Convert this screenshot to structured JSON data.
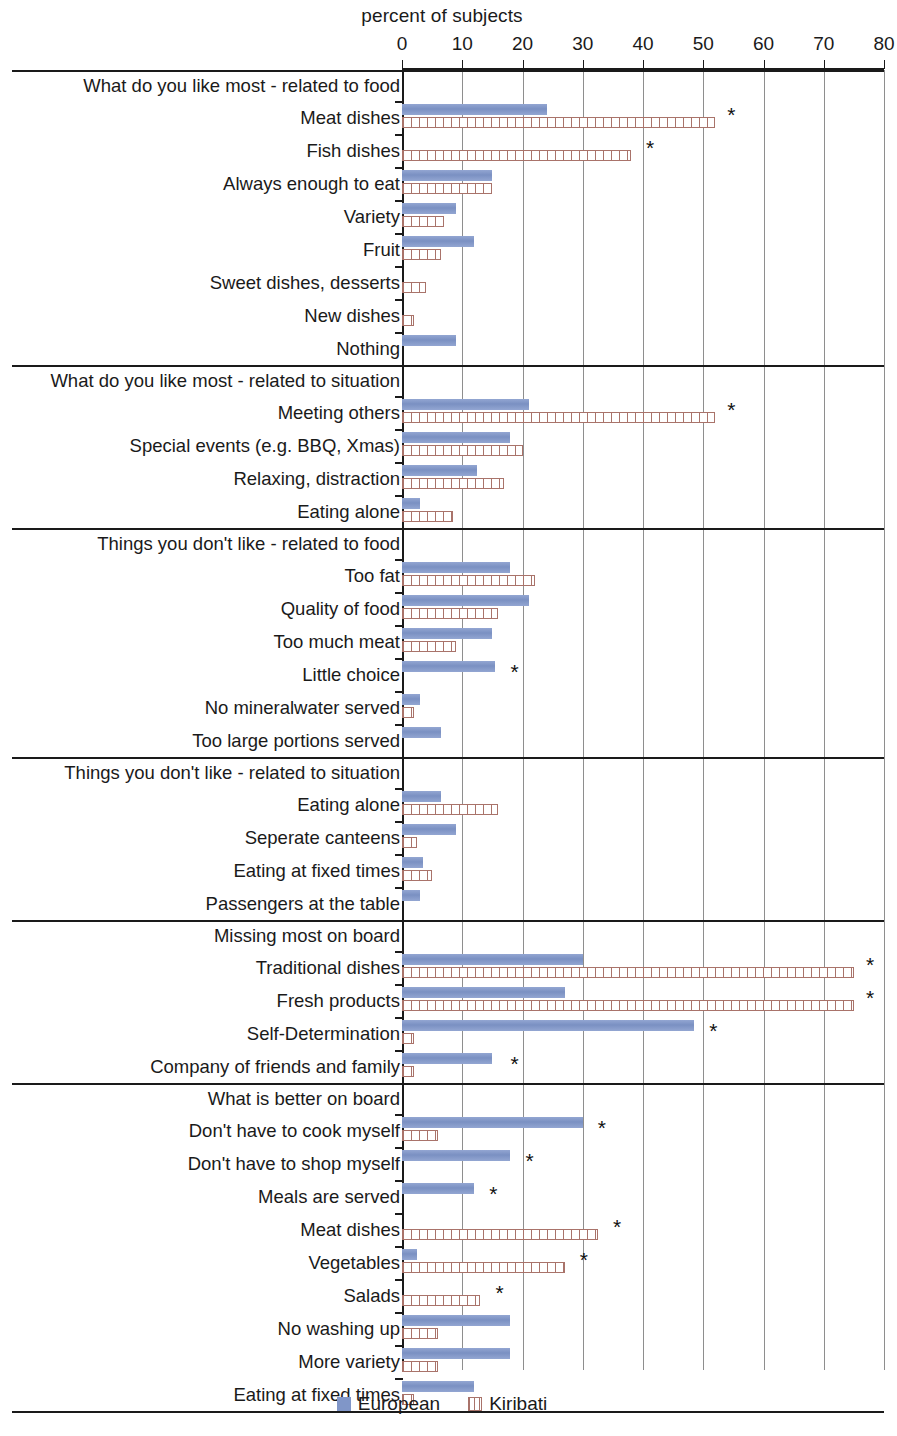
{
  "chart_data": {
    "type": "bar",
    "orientation": "horizontal",
    "title": "percent of subjects",
    "xlabel": "percent of subjects",
    "ylabel": "",
    "xlim": [
      0,
      80
    ],
    "xticks": [
      0,
      10,
      20,
      30,
      40,
      50,
      60,
      70,
      80
    ],
    "grid": true,
    "legend_position": "bottom",
    "series": [
      {
        "name": "European",
        "color": "#8096c8"
      },
      {
        "name": "Kiribati",
        "color": "#a9736a"
      }
    ],
    "significance_marker": "*",
    "sections": [
      {
        "header": "What do you like most - related to food",
        "rows": [
          {
            "label": "Meat dishes",
            "european": 24,
            "kiribati": 52,
            "star": true,
            "star_at": 54
          },
          {
            "label": "Fish dishes",
            "european": null,
            "kiribati": 38,
            "star": true,
            "star_at": 40.5
          },
          {
            "label": "Always enough to eat",
            "european": 15,
            "kiribati": 15,
            "star": false
          },
          {
            "label": "Variety",
            "european": 9,
            "kiribati": 7,
            "star": false
          },
          {
            "label": "Fruit",
            "european": 12,
            "kiribati": 6.5,
            "star": false
          },
          {
            "label": "Sweet dishes, desserts",
            "european": null,
            "kiribati": 4,
            "star": false
          },
          {
            "label": "New dishes",
            "european": null,
            "kiribati": 2,
            "star": false
          },
          {
            "label": "Nothing",
            "european": 9,
            "kiribati": null,
            "star": false
          }
        ]
      },
      {
        "header": "What do you like most - related to situation",
        "rows": [
          {
            "label": "Meeting others",
            "european": 21,
            "kiribati": 52,
            "star": true,
            "star_at": 54
          },
          {
            "label": "Special events (e.g. BBQ, Xmas)",
            "european": 18,
            "kiribati": 20,
            "star": false
          },
          {
            "label": "Relaxing, distraction",
            "european": 12.5,
            "kiribati": 17,
            "star": false
          },
          {
            "label": "Eating alone",
            "european": 3,
            "kiribati": 8.5,
            "star": false
          }
        ]
      },
      {
        "header": "Things you don't like - related to food",
        "rows": [
          {
            "label": "Too fat",
            "european": 18,
            "kiribati": 22,
            "star": false
          },
          {
            "label": "Quality of food",
            "european": 21,
            "kiribati": 16,
            "star": false
          },
          {
            "label": "Too much meat",
            "european": 15,
            "kiribati": 9,
            "star": false
          },
          {
            "label": "Little choice",
            "european": 15.5,
            "kiribati": null,
            "star": true,
            "star_at": 18
          },
          {
            "label": "No mineralwater served",
            "european": 3,
            "kiribati": 2,
            "star": false
          },
          {
            "label": "Too large portions served",
            "european": 6.5,
            "kiribati": null,
            "star": false
          }
        ]
      },
      {
        "header": "Things you don't like - related to situation",
        "rows": [
          {
            "label": "Eating alone",
            "european": 6.5,
            "kiribati": 16,
            "star": false
          },
          {
            "label": "Seperate canteens",
            "european": 9,
            "kiribati": 2.5,
            "star": false
          },
          {
            "label": "Eating at fixed times",
            "european": 3.5,
            "kiribati": 5,
            "star": false
          },
          {
            "label": "Passengers at the table",
            "european": 3,
            "kiribati": null,
            "star": false
          }
        ]
      },
      {
        "header": "Missing most on board",
        "rows": [
          {
            "label": "Traditional dishes",
            "european": 30,
            "kiribati": 75,
            "star": true,
            "star_at": 77
          },
          {
            "label": "Fresh products",
            "european": 27,
            "kiribati": 75,
            "star": true,
            "star_at": 77
          },
          {
            "label": "Self-Determination",
            "european": 48.5,
            "kiribati": 2,
            "star": true,
            "star_at": 51
          },
          {
            "label": "Company of friends and family",
            "european": 15,
            "kiribati": 2,
            "star": true,
            "star_at": 18
          }
        ]
      },
      {
        "header": "What is better on board",
        "rows": [
          {
            "label": "Don't have to cook myself",
            "european": 30,
            "kiribati": 6,
            "star": true,
            "star_at": 32.5
          },
          {
            "label": "Don't have to shop myself",
            "european": 18,
            "kiribati": null,
            "star": true,
            "star_at": 20.5
          },
          {
            "label": "Meals are served",
            "european": 12,
            "kiribati": null,
            "star": true,
            "star_at": 14.5
          },
          {
            "label": "Meat dishes",
            "european": null,
            "kiribati": 32.5,
            "star": true,
            "star_at": 35
          },
          {
            "label": "Vegetables",
            "european": 2.5,
            "kiribati": 27,
            "star": true,
            "star_at": 29.5
          },
          {
            "label": "Salads",
            "european": null,
            "kiribati": 13,
            "star": true,
            "star_at": 15.5
          },
          {
            "label": "No washing up",
            "european": 18,
            "kiribati": 6,
            "star": false
          },
          {
            "label": "More variety",
            "european": 18,
            "kiribati": 6,
            "star": false
          },
          {
            "label": "Eating at fixed times",
            "european": 12,
            "kiribati": 2,
            "star": false
          }
        ]
      }
    ]
  },
  "legend": {
    "items": [
      {
        "label": "European"
      },
      {
        "label": "Kiribati"
      }
    ]
  }
}
